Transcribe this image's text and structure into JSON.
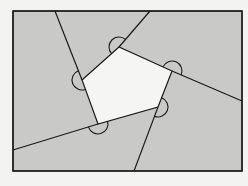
{
  "diagram": {
    "colors": {
      "background": "#f3f3f1",
      "region_fill": "#c9c9c7",
      "pentagon_fill": "#f5f5f4",
      "stroke": "#1a1a1a"
    },
    "rectangle": {
      "x": 13,
      "y": 11,
      "width": 229,
      "height": 160
    },
    "pentagon": {
      "vertices": [
        {
          "name": "A",
          "x": 82,
          "y": 80
        },
        {
          "name": "B",
          "x": 119,
          "y": 47
        },
        {
          "name": "C",
          "x": 172,
          "y": 71
        },
        {
          "name": "D",
          "x": 158,
          "y": 107
        },
        {
          "name": "E",
          "x": 98,
          "y": 124
        }
      ]
    },
    "extended_lines": [
      {
        "from": "A",
        "to": {
          "x": 55,
          "y": 11
        }
      },
      {
        "from": "B",
        "to": {
          "x": 150,
          "y": 11
        }
      },
      {
        "from": "C",
        "to": {
          "x": 242,
          "y": 101
        }
      },
      {
        "from": "D",
        "to": {
          "x": 134,
          "y": 171
        }
      },
      {
        "from": "E",
        "to": {
          "x": 13,
          "y": 150
        }
      }
    ],
    "angle_marks": [
      {
        "vertex": "A",
        "count": 1
      },
      {
        "vertex": "B",
        "count": 1
      },
      {
        "vertex": "C",
        "count": 1
      },
      {
        "vertex": "D",
        "count": 1
      },
      {
        "vertex": "E",
        "count": 1
      }
    ],
    "labels": []
  }
}
